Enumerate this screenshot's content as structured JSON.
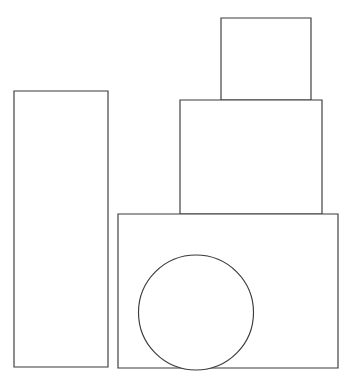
{
  "page": {
    "background_color": "#ffffff",
    "width": 351,
    "height": 386
  },
  "figure": {
    "stroke_color": "#3a3a3a",
    "fill_color": "#ffffff",
    "stroke_width": 1.15,
    "shape_count": 5,
    "shapes": [
      {
        "id": "left-tall-rectangle",
        "type": "rect",
        "label": "Tall narrow vertical rectangle",
        "x": 14,
        "y": 91,
        "width": 94,
        "height": 276
      },
      {
        "id": "top-small-rectangle",
        "type": "rect",
        "label": "Top small rectangle",
        "x": 221,
        "y": 18,
        "width": 90,
        "height": 82
      },
      {
        "id": "middle-rectangle",
        "type": "rect",
        "label": "Middle rectangle",
        "x": 180,
        "y": 100,
        "width": 142,
        "height": 114
      },
      {
        "id": "bottom-large-rectangle",
        "type": "rect",
        "label": "Bottom large rectangle",
        "x": 118,
        "y": 214,
        "width": 220,
        "height": 154
      },
      {
        "id": "circle",
        "type": "circle",
        "label": "Circle overlapping bottom rectangle",
        "cx": 196,
        "cy": 312.5,
        "r": 57.5
      }
    ]
  }
}
